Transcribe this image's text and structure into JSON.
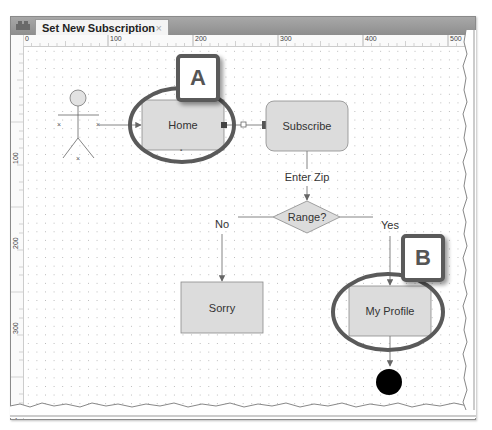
{
  "window": {
    "tab": {
      "title": "Set New Subscription",
      "close_glyph": "×",
      "icon": "diagram-editor-icon"
    }
  },
  "rulers": {
    "top_labels": [
      "0",
      "100",
      "200",
      "300",
      "400",
      "500"
    ],
    "left_labels": [
      "100",
      "200",
      "300",
      "400"
    ]
  },
  "diagram": {
    "actor": {
      "icon": "actor-stick-figure-icon"
    },
    "nodes": {
      "home": {
        "label": "Home"
      },
      "subscribe": {
        "label": "Subscribe"
      },
      "range": {
        "label": "Range?"
      },
      "sorry": {
        "label": "Sorry"
      },
      "my_profile": {
        "label": "My Profile"
      },
      "end": {
        "icon": "final-state-icon"
      }
    },
    "edges": {
      "enter_zip": "Enter Zip",
      "no": "No",
      "yes": "Yes"
    },
    "colors": {
      "node_fill": "#dcdcdc",
      "node_stroke": "#8a8a8a",
      "highlight_stroke": "#5a5a5a",
      "end_fill": "#000000"
    }
  },
  "callouts": {
    "a": "A",
    "b": "B"
  }
}
